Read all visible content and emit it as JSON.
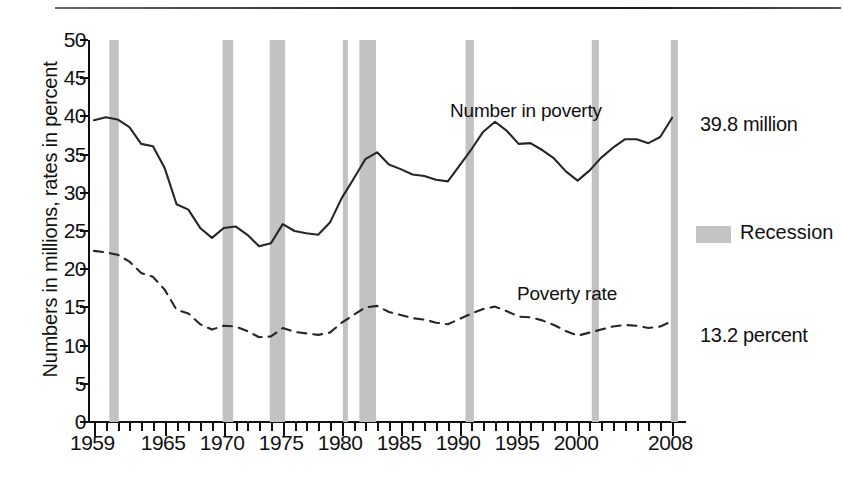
{
  "chart_data": {
    "type": "line",
    "title": "",
    "subtitle": "",
    "xlabel": "",
    "ylabel": "Numbers in millions, rates in percent",
    "xlim": [
      1959,
      2008
    ],
    "ylim": [
      0,
      50
    ],
    "yticks": [
      0,
      5,
      10,
      15,
      20,
      25,
      30,
      35,
      40,
      45,
      50
    ],
    "ytick_labels": [
      "0",
      "5",
      "10",
      "15",
      "20",
      "25",
      "30",
      "35",
      "40",
      "45",
      "50"
    ],
    "xtick_labels": [
      "1959",
      "1965",
      "1970",
      "1975",
      "1980",
      "1985",
      "1990",
      "1995",
      "2000",
      "2008"
    ],
    "xtick_values": [
      1959,
      1965,
      1970,
      1975,
      1980,
      1985,
      1990,
      1995,
      2000,
      2008
    ],
    "grid": false,
    "legend_position": "right",
    "minor_ticks": "every year from 1959 to 2008",
    "x": [
      1959,
      1960,
      1961,
      1962,
      1963,
      1964,
      1965,
      1966,
      1967,
      1968,
      1969,
      1970,
      1971,
      1972,
      1973,
      1974,
      1975,
      1976,
      1977,
      1978,
      1979,
      1980,
      1981,
      1982,
      1983,
      1984,
      1985,
      1986,
      1987,
      1988,
      1989,
      1990,
      1991,
      1992,
      1993,
      1994,
      1995,
      1996,
      1997,
      1998,
      1999,
      2000,
      2001,
      2002,
      2003,
      2004,
      2005,
      2006,
      2007,
      2008
    ],
    "series": [
      {
        "name": "Number in poverty",
        "style": "solid",
        "units": "millions",
        "end_label": "39.8 million",
        "values": [
          39.5,
          39.9,
          39.6,
          38.6,
          36.4,
          36.1,
          33.2,
          28.5,
          27.8,
          25.4,
          24.1,
          25.4,
          25.6,
          24.5,
          23.0,
          23.4,
          25.9,
          25.0,
          24.7,
          24.5,
          26.1,
          29.3,
          31.8,
          34.4,
          35.3,
          33.7,
          33.1,
          32.4,
          32.2,
          31.7,
          31.5,
          33.6,
          35.7,
          38.0,
          39.3,
          38.1,
          36.4,
          36.5,
          35.6,
          34.5,
          32.8,
          31.6,
          32.9,
          34.6,
          35.9,
          37.0,
          37.0,
          36.5,
          37.3,
          39.8
        ]
      },
      {
        "name": "Poverty rate",
        "style": "dashed",
        "units": "percent",
        "end_label": "13.2 percent",
        "values": [
          22.4,
          22.2,
          21.9,
          21.0,
          19.5,
          19.0,
          17.3,
          14.7,
          14.2,
          12.8,
          12.1,
          12.6,
          12.5,
          11.9,
          11.1,
          11.2,
          12.3,
          11.8,
          11.6,
          11.4,
          11.7,
          13.0,
          14.0,
          15.0,
          15.2,
          14.4,
          14.0,
          13.6,
          13.4,
          13.0,
          12.8,
          13.5,
          14.2,
          14.8,
          15.1,
          14.5,
          13.8,
          13.7,
          13.3,
          12.7,
          11.9,
          11.3,
          11.7,
          12.1,
          12.5,
          12.7,
          12.6,
          12.3,
          12.5,
          13.2
        ]
      }
    ],
    "recessions": [
      {
        "label": "1960-61",
        "start": 1960.3,
        "end": 1961.1
      },
      {
        "label": "1969-70",
        "start": 1969.9,
        "end": 1970.8
      },
      {
        "label": "1973-75",
        "start": 1973.9,
        "end": 1975.2
      },
      {
        "label": "1980",
        "start": 1980.1,
        "end": 1980.5
      },
      {
        "label": "1981-82",
        "start": 1981.5,
        "end": 1982.9
      },
      {
        "label": "1990-91",
        "start": 1990.5,
        "end": 1991.2
      },
      {
        "label": "2001",
        "start": 2001.2,
        "end": 2001.8
      },
      {
        "label": "2008",
        "start": 2007.9,
        "end": 2008.5
      }
    ],
    "annotations": [
      {
        "name": "number-in-poverty-label",
        "text": "Number in poverty"
      },
      {
        "name": "poverty-rate-label",
        "text": "Poverty rate"
      },
      {
        "name": "number-end-value",
        "text": "39.8 million"
      },
      {
        "name": "rate-end-value",
        "text": "13.2 percent"
      }
    ]
  },
  "legend": {
    "recession_label": "Recession",
    "recession_color": "#c4c4c4"
  },
  "colors": {
    "line": "#262626",
    "recession": "#c2c2c2",
    "axis": "#111111",
    "background": "#ffffff"
  }
}
